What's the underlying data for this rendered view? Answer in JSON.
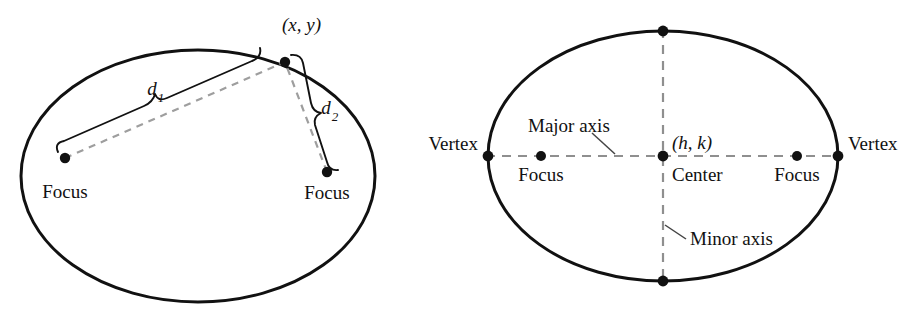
{
  "figure": {
    "background_color": "#ffffff",
    "stroke_color": "#111111",
    "dash_color": "#9a9a9a"
  },
  "left_diagram": {
    "name": "ellipse-focal-distance-definition",
    "ellipse": {
      "cx": 198,
      "cy": 176,
      "rx": 177,
      "ry": 126
    },
    "point_label": "(x, y)",
    "point": {
      "x": 285,
      "y": 62
    },
    "focus_left": {
      "x": 65,
      "y": 158,
      "label": "Focus"
    },
    "focus_right": {
      "x": 327,
      "y": 172,
      "label": "Focus"
    },
    "distance_1_label": "d",
    "distance_1_subscript": "1",
    "distance_2_label": "d",
    "distance_2_subscript": "2"
  },
  "right_diagram": {
    "name": "ellipse-parts-labeled",
    "ellipse": {
      "cx": 663,
      "cy": 156,
      "rx": 175,
      "ry": 125
    },
    "center_label": "Center",
    "center_coords_label": "(h, k)",
    "center_point": {
      "x": 663,
      "y": 156
    },
    "vertex_left": {
      "x": 488,
      "y": 156,
      "label": "Vertex"
    },
    "vertex_right": {
      "x": 838,
      "y": 156,
      "label": "Vertex"
    },
    "focus_left": {
      "x": 541,
      "y": 156,
      "label": "Focus"
    },
    "focus_right": {
      "x": 797,
      "y": 156,
      "label": "Focus"
    },
    "covertex_top": {
      "x": 663,
      "y": 31
    },
    "covertex_bottom": {
      "x": 663,
      "y": 281
    },
    "major_axis_label": "Major axis",
    "minor_axis_label": "Minor axis"
  }
}
